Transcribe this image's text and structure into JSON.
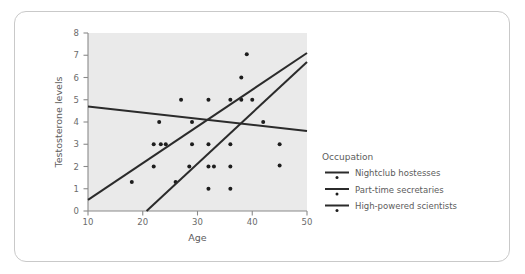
{
  "figure": {
    "background_color": "#ffffff",
    "frame_color": "#c9c9c9",
    "plot_background_color": "#eaeaea",
    "mark_color": "#1d1d1d"
  },
  "chart_data": {
    "type": "scatter",
    "title": "",
    "xlabel": "Age",
    "ylabel": "Testosterone levels",
    "xlim": [
      10,
      50
    ],
    "ylim": [
      0,
      8
    ],
    "xticks": [
      10,
      20,
      30,
      40,
      50
    ],
    "yticks": [
      0,
      1,
      2,
      3,
      4,
      5,
      6,
      7,
      8
    ],
    "grid": false,
    "legend": {
      "title": "Occupation",
      "position": "right",
      "entries": [
        "Nightclub hostesses",
        "Part-time secretaries",
        "High-powered scientists"
      ]
    },
    "series": [
      {
        "name": "Nightclub hostesses",
        "marker": "dot",
        "fit": {
          "type": "linear",
          "x_start": 10,
          "y_start": 4.7,
          "x_end": 50,
          "y_end": 3.6,
          "slope": -0.0275,
          "intercept": 4.975
        },
        "points": [
          [
            27,
            5.0
          ],
          [
            32,
            5.0
          ],
          [
            36,
            5.0
          ],
          [
            38,
            5.0
          ],
          [
            40,
            5.0
          ],
          [
            23,
            4.0
          ],
          [
            29,
            4.0
          ],
          [
            42,
            4.0
          ]
        ]
      },
      {
        "name": "Part-time secretaries",
        "marker": "dot",
        "fit": {
          "type": "linear",
          "x_start": 10,
          "y_start": 0.5,
          "x_end": 50,
          "y_end": 7.1,
          "slope": 0.165,
          "intercept": -1.15
        },
        "points": [
          [
            22,
            3.0
          ],
          [
            23.3,
            3.0
          ],
          [
            24.2,
            3.0
          ],
          [
            29,
            3.0
          ],
          [
            32,
            3.0
          ],
          [
            36,
            3.0
          ],
          [
            45,
            3.0
          ],
          [
            18,
            1.3
          ],
          [
            22,
            2.0
          ],
          [
            26,
            1.3
          ]
        ]
      },
      {
        "name": "High-powered scientists",
        "marker": "dot",
        "fit": {
          "type": "linear",
          "x_start": 20.7,
          "y_start": 0.0,
          "x_end": 50,
          "y_end": 6.7,
          "slope": 0.2287,
          "intercept": -4.733
        },
        "points": [
          [
            39,
            7.05
          ],
          [
            38,
            6.0
          ],
          [
            28.5,
            2.0
          ],
          [
            32,
            2.0
          ],
          [
            33,
            2.0
          ],
          [
            36,
            2.0
          ],
          [
            45,
            2.05
          ],
          [
            32,
            1.0
          ],
          [
            36,
            1.0
          ]
        ]
      }
    ],
    "all_points_flat": [
      [
        18,
        1.3
      ],
      [
        22,
        2.0
      ],
      [
        22,
        3.0
      ],
      [
        23.3,
        3.0
      ],
      [
        24.2,
        3.0
      ],
      [
        23,
        4.0
      ],
      [
        26,
        1.3
      ],
      [
        27,
        5.0
      ],
      [
        28.5,
        2.0
      ],
      [
        29,
        3.0
      ],
      [
        29,
        4.0
      ],
      [
        32,
        1.0
      ],
      [
        32,
        2.0
      ],
      [
        32,
        3.0
      ],
      [
        32,
        5.0
      ],
      [
        33,
        2.0
      ],
      [
        36,
        1.0
      ],
      [
        36,
        2.0
      ],
      [
        36,
        3.0
      ],
      [
        36,
        5.0
      ],
      [
        38,
        5.0
      ],
      [
        38,
        6.0
      ],
      [
        39,
        7.05
      ],
      [
        40,
        5.0
      ],
      [
        42,
        4.0
      ],
      [
        45,
        2.05
      ],
      [
        45,
        3.0
      ]
    ]
  }
}
